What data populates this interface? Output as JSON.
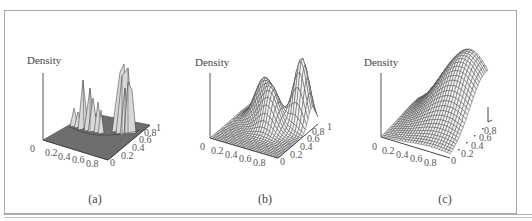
{
  "figure": {
    "panels": [
      {
        "id": "a",
        "caption": "(a)",
        "zlabel": "Density"
      },
      {
        "id": "b",
        "caption": "(b)",
        "zlabel": "Density"
      },
      {
        "id": "c",
        "caption": "(c)",
        "zlabel": "Density"
      }
    ],
    "x_ticks": [
      "0",
      "0.2",
      "0.4",
      "0.6",
      "0.8"
    ],
    "y_ticks": [
      "0",
      "0.2",
      "0.4",
      "0.6",
      "0.8",
      "1"
    ],
    "y_ticks_c": [
      "0",
      "0.2",
      "0.4",
      "0.6",
      "0.8"
    ]
  },
  "chart_data": [
    {
      "type": "surface",
      "title": "(a)",
      "zlabel": "Density",
      "xlabel": "",
      "ylabel": "",
      "x_ticks": [
        0,
        0.2,
        0.4,
        0.6,
        0.8
      ],
      "y_ticks": [
        0,
        0.2,
        0.4,
        0.6,
        0.8,
        1
      ],
      "xlim": [
        0,
        1
      ],
      "ylim": [
        0,
        1
      ],
      "description": "Spiky, highly multimodal density estimate (undersmoothed) with a cluster of sharp peaks near the center and a tall group of peaks toward the back-right; shaded surface on a flat gray base."
    },
    {
      "type": "surface",
      "title": "(b)",
      "zlabel": "Density",
      "x_ticks": [
        0,
        0.2,
        0.4,
        0.6,
        0.8
      ],
      "y_ticks": [
        0,
        0.2,
        0.4,
        0.6,
        0.8,
        1
      ],
      "xlim": [
        0,
        1
      ],
      "ylim": [
        0,
        1
      ],
      "description": "Smooth trimodal wireframe density: two moderate bumps near the middle and one taller peak toward the back-right."
    },
    {
      "type": "surface",
      "title": "(c)",
      "zlabel": "Density",
      "x_ticks": [
        0,
        0.2,
        0.4,
        0.6,
        0.8
      ],
      "y_ticks": [
        0,
        0.2,
        0.4,
        0.6,
        0.8
      ],
      "xlim": [
        0,
        1
      ],
      "ylim": [
        0,
        1
      ],
      "description": "Oversmoothed unimodal wireframe density: a single broad ridge rising toward the back, peaking near the rear edge."
    }
  ]
}
